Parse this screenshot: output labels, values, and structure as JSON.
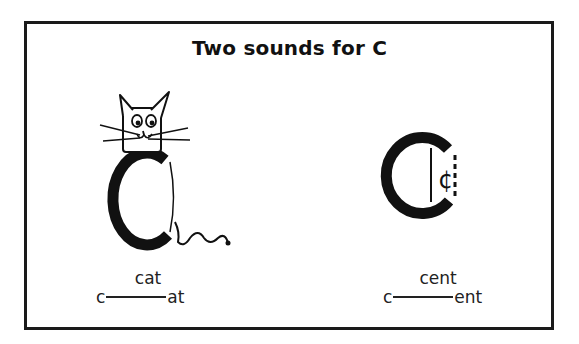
{
  "title": "Two sounds for C",
  "examples": [
    {
      "illustration": "cat-on-letter-c-icon",
      "word": "cat",
      "onset": "c",
      "rime": "at",
      "sound": "hard c"
    },
    {
      "illustration": "cent-sign-in-letter-c-icon",
      "word": "cent",
      "onset": "c",
      "rime": "ent",
      "sound": "soft c"
    }
  ],
  "colors": {
    "ink": "#111111",
    "background": "#ffffff",
    "frame": "#1a1a1a"
  }
}
